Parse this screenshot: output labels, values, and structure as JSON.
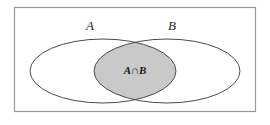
{
  "figure": {
    "background_color": "#ffffff",
    "frame": {
      "stroke_color": "#9a9a9a",
      "stroke_width": 1.2,
      "x": 14,
      "y": 7,
      "width": 242,
      "height": 105
    },
    "labels": {
      "set_a": "A",
      "set_b": "B",
      "intersection": "A∩B"
    },
    "sets": [
      {
        "name": "A",
        "label": "A",
        "shape": "ellipse",
        "cx": 103,
        "cy": 71,
        "rx": 73,
        "ry": 32,
        "fill": "#ffffff",
        "stroke_color": "#4a4a4a",
        "stroke_width": 1
      },
      {
        "name": "B",
        "label": "B",
        "shape": "ellipse",
        "cx": 167,
        "cy": 71,
        "rx": 73,
        "ry": 32,
        "fill": "#ffffff",
        "stroke_color": "#4a4a4a",
        "stroke_width": 1
      }
    ],
    "intersection": {
      "label": "A∩B",
      "fill_color": "#c9c9c9",
      "stroke_color": "#3a3a3a",
      "stroke_width": 1.1,
      "label_x": 135,
      "label_y": 74
    },
    "label_positions": {
      "set_a_x": 90,
      "set_a_y": 30,
      "set_b_x": 172,
      "set_b_y": 30
    }
  }
}
